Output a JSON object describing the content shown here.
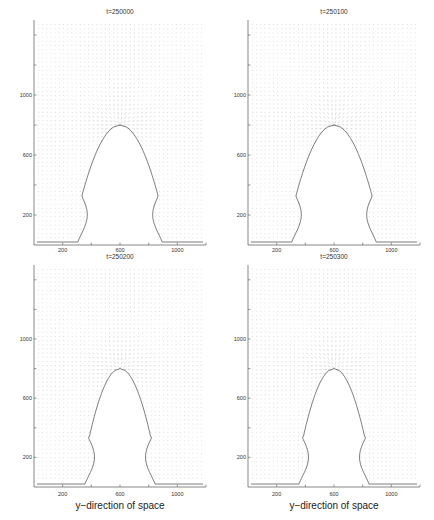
{
  "chart_data": [
    {
      "type": "quiver",
      "title": "t=250000",
      "xlabel": "",
      "ylabel": "",
      "xticks": [
        200,
        600,
        1000
      ],
      "yticks": [
        200,
        600,
        1000
      ],
      "xlim": [
        0,
        1200
      ],
      "ylim": [
        0,
        1500
      ],
      "bubble": {
        "center_x": 600,
        "top_y": 800,
        "base_left_x": 320,
        "base_right_x": 860,
        "floor_y": 20
      },
      "grid": false
    },
    {
      "type": "quiver",
      "title": "t=250100",
      "xlabel": "",
      "ylabel": "",
      "xticks": [
        200,
        600,
        1000
      ],
      "yticks": [
        200,
        600,
        1000
      ],
      "xlim": [
        0,
        1200
      ],
      "ylim": [
        0,
        1500
      ],
      "bubble": {
        "center_x": 600,
        "top_y": 800,
        "base_left_x": 320,
        "base_right_x": 860,
        "floor_y": 20
      },
      "grid": false
    },
    {
      "type": "quiver",
      "title": "t=250200",
      "xlabel": "y−direction of space",
      "ylabel": "",
      "xticks": [
        200,
        600,
        1000
      ],
      "yticks": [
        200,
        600,
        1000
      ],
      "xlim": [
        0,
        1200
      ],
      "ylim": [
        0,
        1500
      ],
      "bubble": {
        "center_x": 600,
        "top_y": 800,
        "base_left_x": 380,
        "base_right_x": 820,
        "floor_y": 20
      },
      "grid": false
    },
    {
      "type": "quiver",
      "title": "t=250300",
      "xlabel": "y−direction of space",
      "ylabel": "",
      "xticks": [
        200,
        600,
        1000
      ],
      "yticks": [
        200,
        600,
        1000
      ],
      "xlim": [
        0,
        1200
      ],
      "ylim": [
        0,
        1500
      ],
      "bubble": {
        "center_x": 600,
        "top_y": 800,
        "base_left_x": 380,
        "base_right_x": 820,
        "floor_y": 20
      },
      "grid": false
    }
  ],
  "panels": [
    {
      "title": "t=250000",
      "xlabel": "",
      "xticks": [
        "200",
        "600",
        "1000"
      ],
      "yticks": [
        "200",
        "600",
        "1000"
      ]
    },
    {
      "title": "t=250100",
      "xlabel": "",
      "xticks": [
        "200",
        "600",
        "1000"
      ],
      "yticks": [
        "200",
        "600",
        "1000"
      ]
    },
    {
      "title": "t=250200",
      "xlabel": "y−direction of space",
      "xticks": [
        "200",
        "600",
        "1000"
      ],
      "yticks": [
        "200",
        "600",
        "1000"
      ]
    },
    {
      "title": "t=250300",
      "xlabel": "y−direction of space",
      "xticks": [
        "200",
        "600",
        "1000"
      ],
      "yticks": [
        "200",
        "600",
        "1000"
      ]
    }
  ]
}
